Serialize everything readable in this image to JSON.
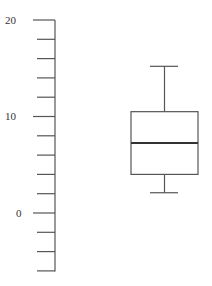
{
  "chart_data": {
    "type": "box",
    "title": "",
    "xlabel": "",
    "ylabel": "",
    "ylim": [
      -6,
      20
    ],
    "grid": false,
    "legend": null,
    "y_major_ticks": [
      0,
      10,
      20
    ],
    "y_tick_labels": [
      "0",
      "10",
      "20"
    ],
    "y_minor_step": 2,
    "series": [
      {
        "name": "",
        "whisker_low": 2.1,
        "q1": 4.0,
        "median": 7.25,
        "q3": 10.5,
        "whisker_high": 15.2
      }
    ]
  },
  "colors": {
    "axis": "#555555",
    "box_stroke": "#555555",
    "median": "#333333",
    "background": "#ffffff"
  }
}
